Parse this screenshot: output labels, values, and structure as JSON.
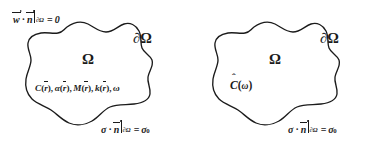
{
  "figure": {
    "background_color": "#ffffff",
    "stroke_color": "#1b1b1b"
  },
  "panels": [
    {
      "id": "left",
      "domain_label": "Ω",
      "boundary_label": {
        "partial": "∂",
        "omega": "Ω"
      },
      "top_condition": {
        "lhs_vec1": "w",
        "dot": "·",
        "lhs_vec2": "n",
        "restriction": "∂Ω",
        "equals": "=",
        "rhs": "0"
      },
      "bottom_condition": {
        "lhs_sym": "σ",
        "dot": "·",
        "lhs_vec2": "n",
        "restriction": "∂Ω",
        "equals": "=",
        "rhs": "σ",
        "rhs_sub": "0"
      },
      "interior_text": {
        "items": [
          {
            "symbol": "C",
            "arg": "r"
          },
          {
            "symbol": "α",
            "arg": "r"
          },
          {
            "symbol": "M",
            "arg": "r"
          },
          {
            "symbol": "k",
            "arg": "r"
          }
        ],
        "last": "ω",
        "comma": ","
      }
    },
    {
      "id": "right",
      "domain_label": "Ω",
      "boundary_label": {
        "partial": "∂",
        "omega": "Ω"
      },
      "bottom_condition": {
        "lhs_sym": "σ",
        "dot": "·",
        "lhs_vec2": "n",
        "restriction": "∂Ω",
        "equals": "=",
        "rhs": "σ",
        "rhs_sub": "0"
      },
      "interior_text": {
        "symbol": "C",
        "open": "(",
        "arg": "ω",
        "close": ")"
      }
    }
  ]
}
